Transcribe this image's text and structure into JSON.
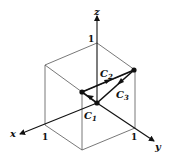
{
  "diagram": {
    "type": "3d-unit-cube-path",
    "axes": {
      "x_label": "x",
      "y_label": "y",
      "z_label": "z",
      "x_tick": "1",
      "y_tick": "1",
      "z_tick": "1"
    },
    "curves": {
      "c1_label": "C",
      "c1_sub": "1",
      "c2_label": "C",
      "c2_sub": "2",
      "c3_label": "C",
      "c3_sub": "3"
    },
    "colors": {
      "ink": "#111111",
      "cube_edges": "#555555",
      "background": "#ffffff"
    }
  }
}
